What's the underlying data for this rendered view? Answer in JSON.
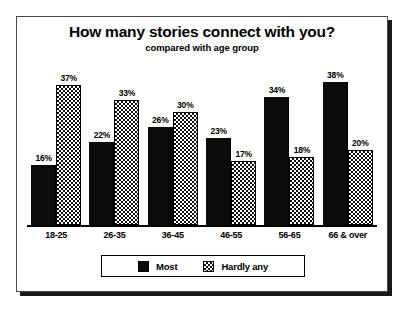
{
  "chart_data": {
    "type": "bar",
    "title": "How many stories connect with you?",
    "subtitle": "compared with age group",
    "xlabel": "",
    "ylabel": "",
    "ylim": [
      0,
      40
    ],
    "grid": false,
    "legend_position": "bottom",
    "value_suffix": "%",
    "categories": [
      "18-25",
      "26-35",
      "36-45",
      "46-55",
      "56-65",
      "66 & over"
    ],
    "series": [
      {
        "name": "Most",
        "fill": "solid-black",
        "color": "#0b0b0b",
        "values": [
          16,
          22,
          26,
          23,
          34,
          38
        ],
        "labels": [
          "16%",
          "22%",
          "26%",
          "23%",
          "34%",
          "38%"
        ]
      },
      {
        "name": "Hardly any",
        "fill": "checkered",
        "color": "#ffffff",
        "values": [
          37,
          33,
          30,
          17,
          18,
          20
        ],
        "labels": [
          "37%",
          "33%",
          "30%",
          "17%",
          "18%",
          "20%"
        ]
      }
    ]
  },
  "legend": {
    "items": [
      {
        "label": "Most"
      },
      {
        "label": "Hardly any"
      }
    ]
  }
}
